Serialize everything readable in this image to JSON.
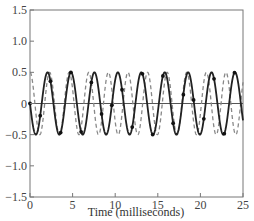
{
  "chart_data": {
    "type": "line",
    "title": "",
    "xlabel": "Time (milliseconds)",
    "ylabel": "",
    "xlim": [
      0,
      25
    ],
    "ylim": [
      -1.5,
      1.5
    ],
    "xticks": [
      0,
      5,
      10,
      15,
      20,
      25
    ],
    "yticks": [
      1.5,
      1.0,
      0.5,
      0,
      -0.5,
      -1.0,
      -1.5
    ],
    "xtick_labels": [
      "0",
      "5",
      "10",
      "15",
      "20",
      "25"
    ],
    "ytick_labels": [
      "1.5",
      "1.0",
      "0.5",
      "0",
      "−0.5",
      "−1.0",
      "−1.5"
    ],
    "grid": false,
    "zero_line": true,
    "legend": null,
    "series": [
      {
        "name": "solid sinusoid with sample markers",
        "style": "solid",
        "color": "#222222",
        "amplitude": 0.5,
        "period_ms": 2.75,
        "phase": "negative sine (starts at 0, first trough ~0.7 ms, first peak ~2.1 ms)",
        "markers": "filled dots at sample points",
        "peaks_x_ms": [
          2.1,
          4.8,
          7.6,
          10.3,
          13.1,
          15.8,
          18.5,
          21.3,
          24.1
        ],
        "peak_value": 0.5,
        "trough_value": -0.5
      },
      {
        "name": "dashed sinusoid (higher frequency)",
        "style": "dashed",
        "color": "#888888",
        "amplitude": 0.5,
        "period_ms": 2.3,
        "peak_value": 0.5,
        "trough_value": -0.5
      }
    ]
  },
  "labels": {
    "x_axis_title": "Time (milliseconds)"
  }
}
